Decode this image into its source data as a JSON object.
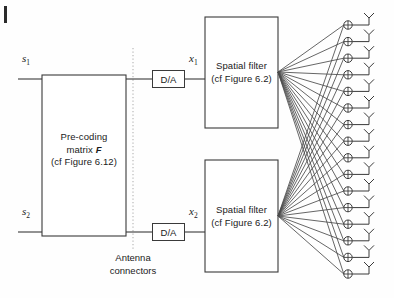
{
  "figure": {
    "line_color": "#3a3a3a",
    "text_color": "#1a1a1a",
    "background": "#fefefe",
    "dotted_line_color": "#b8b8b8"
  },
  "inputs": [
    {
      "label": "s",
      "subscript": "1",
      "name": "input-s1"
    },
    {
      "label": "s",
      "subscript": "2",
      "name": "input-s2"
    }
  ],
  "precoding_block": {
    "line1": "Pre-coding",
    "line2_prefix": "matrix ",
    "line2_symbol": "F",
    "line3": "(cf Figure 6.12)"
  },
  "converters": [
    {
      "label": "D/A",
      "name": "da-converter-1"
    },
    {
      "label": "D/A",
      "name": "da-converter-2"
    }
  ],
  "outputs": [
    {
      "label": "x",
      "subscript": "1",
      "name": "signal-x1"
    },
    {
      "label": "x",
      "subscript": "2",
      "name": "signal-x2"
    }
  ],
  "spatial_filters": [
    {
      "line1": "Spatial filter",
      "line2": "(cf Figure 6.2)",
      "name": "spatial-filter-1"
    },
    {
      "line1": "Spatial filter",
      "line2": "(cf Figure 6.2)",
      "name": "spatial-filter-2"
    }
  ],
  "connectors_label": {
    "line1": "Antenna",
    "line2": "connectors"
  },
  "antenna_array": {
    "element_count": 16,
    "junction_symbol": "circle-plus",
    "antenna_symbol": "dipole-y"
  }
}
